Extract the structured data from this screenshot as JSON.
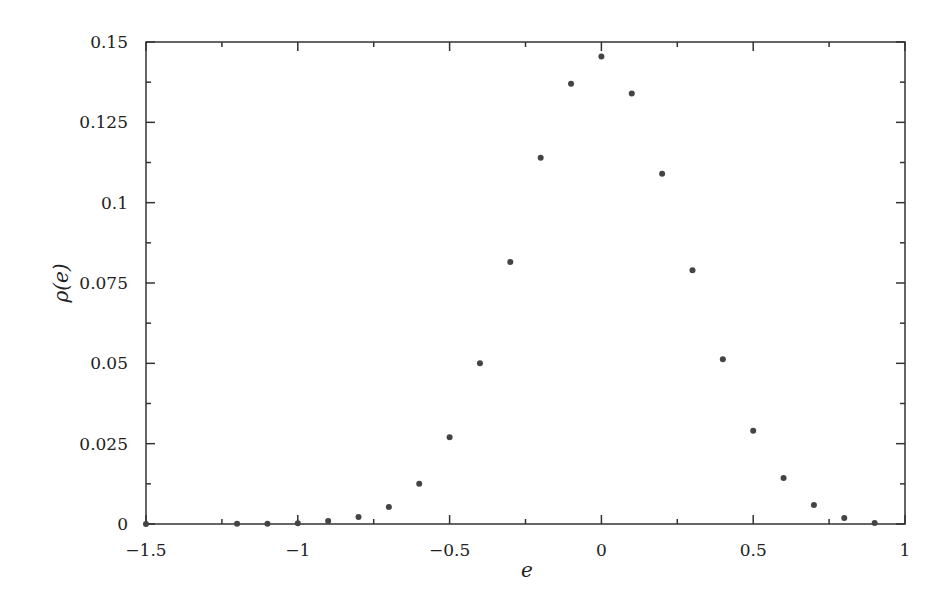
{
  "chart_data": {
    "type": "scatter",
    "title": "",
    "xlabel": "e",
    "ylabel": "ρ(e)",
    "xlim": [
      -1.5,
      1
    ],
    "ylim": [
      0,
      0.15
    ],
    "grid": false,
    "legend": null,
    "x_ticks": [
      -1.5,
      -1,
      -0.5,
      0,
      0.5,
      1
    ],
    "x_tick_labels": [
      "−1.5",
      "−1",
      "−0.5",
      "0",
      "0.5",
      "1"
    ],
    "x_minor_ticks": [
      -1.25,
      -0.75,
      -0.25,
      0.25,
      0.75
    ],
    "y_ticks": [
      0,
      0.025,
      0.05,
      0.075,
      0.1,
      0.125,
      0.15
    ],
    "y_tick_labels": [
      "0",
      "0.025",
      "0.05",
      "0.075",
      "0.1",
      "0.125",
      "0.15"
    ],
    "y_minor_ticks": [
      0.0125,
      0.0375,
      0.0625,
      0.0875,
      0.1125,
      0.1375
    ],
    "series": [
      {
        "name": "ρ(e)",
        "marker": "dot",
        "color": "#333333",
        "x": [
          -1.5,
          -1.2,
          -1.1,
          -1.0,
          -0.9,
          -0.8,
          -0.7,
          -0.6,
          -0.5,
          -0.4,
          -0.3,
          -0.2,
          -0.1,
          0.0,
          0.1,
          0.2,
          0.3,
          0.4,
          0.5,
          0.6,
          0.7,
          0.8,
          0.9
        ],
        "y": [
          0.0,
          0.0001,
          0.0001,
          0.0002,
          0.0009,
          0.0022,
          0.0053,
          0.0125,
          0.027,
          0.05,
          0.0815,
          0.114,
          0.137,
          0.1455,
          0.134,
          0.109,
          0.079,
          0.0513,
          0.029,
          0.0143,
          0.0059,
          0.0019,
          0.0003
        ]
      }
    ]
  },
  "layout": {
    "plot_left": 146,
    "plot_right": 905,
    "plot_top": 42,
    "plot_bottom": 524,
    "axis_color": "#333333",
    "point_color": "#444444"
  }
}
